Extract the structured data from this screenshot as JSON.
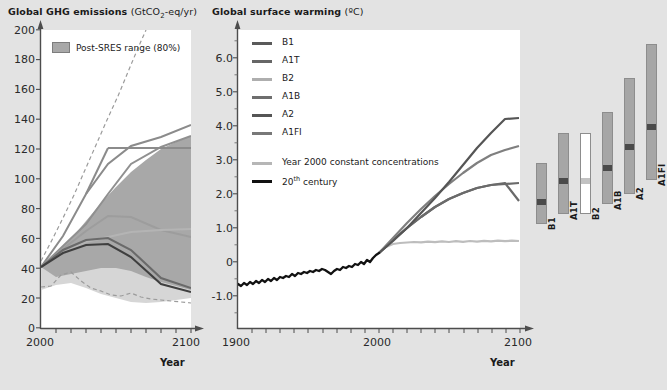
{
  "figure": {
    "background_color": "#e3e3e3",
    "plot_background": "#ffffff"
  },
  "left_panel": {
    "title_main": "Global GHG emissions",
    "title_unit_pre": "(GtCO",
    "title_unit_sub": "2",
    "title_unit_post": "-eq/yr)",
    "legend_label": "Post-SRES range (80%)",
    "legend_swatch_color": "#a8a8a8",
    "xlabel": "Year",
    "yticks": [
      "0",
      "20",
      "40",
      "60",
      "80",
      "100",
      "120",
      "140",
      "160",
      "180",
      "200"
    ],
    "xticks": [
      "2000",
      "2100"
    ]
  },
  "middle_panel": {
    "title_main": "Global surface warming",
    "title_unit": "(ºC)",
    "xlabel": "Year",
    "yticks": [
      "-1.0",
      "0",
      "1.0",
      "2.0",
      "3.0",
      "4.0",
      "5.0",
      "6.0"
    ],
    "xticks": [
      "1900",
      "2000",
      "2100"
    ],
    "legend": [
      {
        "label": "B1",
        "color": "#5a5a5a"
      },
      {
        "label": "A1T",
        "color": "#666666"
      },
      {
        "label": "B2",
        "color": "#aeaeae"
      },
      {
        "label": "A1B",
        "color": "#6e6e6e"
      },
      {
        "label": "A2",
        "color": "#555555"
      },
      {
        "label": "A1FI",
        "color": "#787878"
      },
      {
        "label": "Year 2000 constant concentrations",
        "color": "#b6b6b6"
      },
      {
        "label_pre": "20",
        "label_sup": "th",
        "label_post": " century",
        "color": "#111111"
      }
    ]
  },
  "right_panel": {
    "bars": [
      {
        "label": "B1",
        "low": 1.1,
        "high": 2.9,
        "best": 1.8,
        "fill": "#a6a6a6",
        "mark": "#4a4a4a"
      },
      {
        "label": "A1T",
        "low": 1.4,
        "high": 3.8,
        "best": 2.4,
        "fill": "#a6a6a6",
        "mark": "#4a4a4a"
      },
      {
        "label": "B2",
        "low": 1.4,
        "high": 3.8,
        "best": 2.4,
        "fill": "#ffffff",
        "mark": "#c2c2c2"
      },
      {
        "label": "A1B",
        "low": 1.7,
        "high": 4.4,
        "best": 2.8,
        "fill": "#a6a6a6",
        "mark": "#4a4a4a"
      },
      {
        "label": "A2",
        "low": 2.0,
        "high": 5.4,
        "best": 3.4,
        "fill": "#a6a6a6",
        "mark": "#4a4a4a"
      },
      {
        "label": "A1FI",
        "low": 2.4,
        "high": 6.4,
        "best": 4.0,
        "fill": "#a6a6a6",
        "mark": "#4a4a4a"
      }
    ]
  },
  "chart_data": [
    {
      "type": "area",
      "id": "ghg-emissions",
      "title": "Global GHG emissions (GtCO2-eq/yr)",
      "xlabel": "Year",
      "ylabel": "GtCO2-eq/yr",
      "xlim": [
        2000,
        2100
      ],
      "ylim": [
        0,
        200
      ],
      "grid": false,
      "legend_position": "top-left",
      "bands": [
        {
          "name": "Post-SRES range (80%)",
          "fill": "#a8a8a8",
          "x": [
            2000,
            2010,
            2020,
            2030,
            2040,
            2050,
            2060,
            2070,
            2080,
            2090,
            2100
          ],
          "upper": [
            41,
            50,
            60,
            72,
            84,
            95,
            105,
            113,
            120,
            125,
            129
          ],
          "lower": [
            41,
            38,
            36,
            38,
            40,
            40,
            38,
            34,
            31,
            28,
            26
          ]
        },
        {
          "name": "Post-SRES range outer (dashed bounds)",
          "style": "dashed",
          "x": [
            2000,
            2010,
            2020,
            2030,
            2040,
            2050,
            2060,
            2070,
            2080,
            2090,
            2100
          ],
          "upper": [
            41,
            62,
            84,
            108,
            132,
            158,
            182,
            200,
            200,
            200,
            200
          ],
          "lower": [
            28,
            29,
            35,
            31,
            27,
            23,
            22,
            24,
            21,
            19,
            17
          ]
        }
      ],
      "series": [
        {
          "name": "A1FI",
          "color": "#7a7a7a",
          "x": [
            2000,
            2020,
            2040,
            2060,
            2080,
            2100
          ],
          "values": [
            41,
            62,
            89,
            110,
            122,
            136
          ]
        },
        {
          "name": "A2",
          "color": "#6a6a6a",
          "x": [
            2000,
            2020,
            2040,
            2060,
            2080,
            2100
          ],
          "values": [
            41,
            55,
            70,
            90,
            110,
            129
          ]
        },
        {
          "name": "A1B",
          "color": "#888888",
          "x": [
            2000,
            2020,
            2040,
            2060,
            2080,
            2100
          ],
          "values": [
            41,
            54,
            66,
            75,
            71,
            61
          ]
        },
        {
          "name": "A1T",
          "color": "#9a9a9a",
          "x": [
            2000,
            2020,
            2040,
            2060,
            2080,
            2100
          ],
          "values": [
            41,
            50,
            58,
            57,
            62,
            66
          ]
        },
        {
          "name": "B2",
          "color": "#5e5e5e",
          "x": [
            2000,
            2020,
            2040,
            2060,
            2080,
            2100
          ],
          "values": [
            41,
            50,
            58,
            57,
            44,
            27
          ]
        },
        {
          "name": "B1",
          "color": "#4e4e4e",
          "x": [
            2000,
            2020,
            2040,
            2060,
            2080,
            2100
          ],
          "values": [
            41,
            48,
            55,
            54,
            40,
            24
          ]
        }
      ]
    },
    {
      "type": "line",
      "id": "surface-warming",
      "title": "Global surface warming (ºC)",
      "xlabel": "Year",
      "ylabel": "ºC",
      "xlim": [
        1900,
        2100
      ],
      "ylim": [
        -1.0,
        6.5
      ],
      "grid": false,
      "legend_position": "top-left",
      "series": [
        {
          "name": "20th century",
          "color": "#111111",
          "x": [
            1900,
            1910,
            1920,
            1930,
            1940,
            1950,
            1960,
            1970,
            1980,
            1990,
            2000
          ],
          "values": [
            -0.65,
            -0.62,
            -0.55,
            -0.45,
            -0.32,
            -0.3,
            -0.25,
            -0.2,
            -0.05,
            0.08,
            0.2
          ]
        },
        {
          "name": "A2",
          "color": "#555555",
          "x": [
            2000,
            2020,
            2040,
            2060,
            2080,
            2100
          ],
          "values": [
            0.25,
            0.75,
            1.35,
            2.05,
            2.8,
            3.5
          ]
        },
        {
          "name": "A1B",
          "color": "#7a7a7a",
          "x": [
            2000,
            2020,
            2040,
            2060,
            2080,
            2100
          ],
          "values": [
            0.25,
            0.8,
            1.4,
            1.95,
            2.4,
            2.7
          ]
        },
        {
          "name": "B1",
          "color": "#6a6a6a",
          "x": [
            2000,
            2020,
            2040,
            2060,
            2080,
            2100
          ],
          "values": [
            0.25,
            0.65,
            1.05,
            1.4,
            1.65,
            1.8
          ]
        },
        {
          "name": "Year 2000 constant concentrations",
          "color": "#bdbdbd",
          "x": [
            2000,
            2020,
            2040,
            2060,
            2080,
            2100
          ],
          "values": [
            0.25,
            0.45,
            0.52,
            0.56,
            0.58,
            0.6
          ]
        }
      ]
    },
    {
      "type": "bar",
      "id": "likely-ranges-2090-2099",
      "title": "Likely range of surface warming at 2090-2099",
      "ylabel": "ºC",
      "ylim": [
        -1.0,
        6.5
      ],
      "categories": [
        "B1",
        "A1T",
        "B2",
        "A1B",
        "A2",
        "A1FI"
      ],
      "best_estimate": [
        1.8,
        2.4,
        2.4,
        2.8,
        3.4,
        4.0
      ],
      "range_low": [
        1.1,
        1.4,
        1.4,
        1.7,
        2.0,
        2.4
      ],
      "range_high": [
        2.9,
        3.8,
        3.8,
        4.4,
        5.4,
        6.4
      ]
    }
  ]
}
